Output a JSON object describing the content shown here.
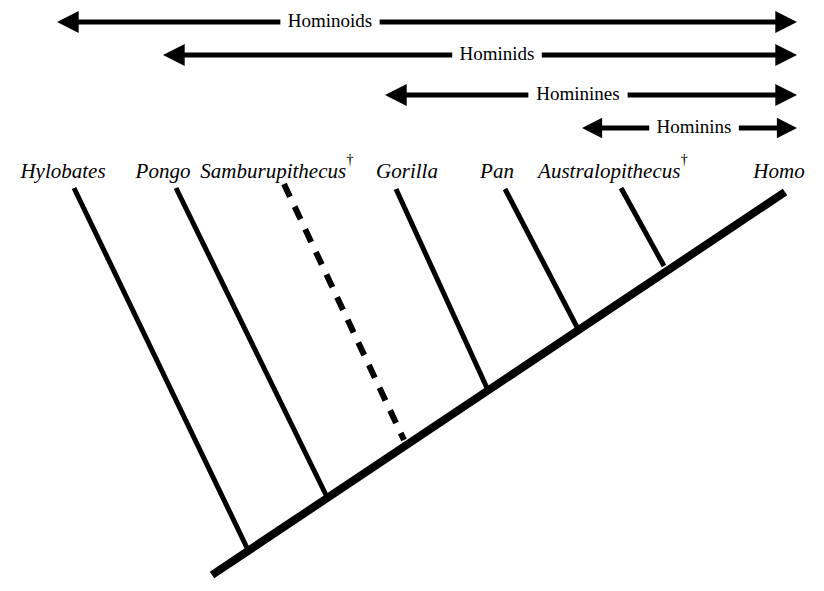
{
  "figure": {
    "kind": "cladogram",
    "background_color": "#ffffff",
    "line_color": "#000000"
  },
  "clade_brackets": [
    {
      "label": "Hominoids",
      "row": 1,
      "y": 22,
      "left_x": 57,
      "right_x": 797,
      "label_center_x": 330,
      "shaft_thickness": 5,
      "head_size": 14,
      "left_arrowhead": true,
      "right_arrowhead": true
    },
    {
      "label": "Hominids",
      "row": 2,
      "y": 55,
      "left_x": 163,
      "right_x": 797,
      "label_center_x": 497,
      "shaft_thickness": 5,
      "head_size": 14,
      "left_arrowhead": true,
      "right_arrowhead": true
    },
    {
      "label": "Hominines",
      "row": 3,
      "y": 95,
      "left_x": 385,
      "right_x": 797,
      "label_center_x": 578,
      "shaft_thickness": 5,
      "head_size": 14,
      "left_arrowhead": true,
      "right_arrowhead": true
    },
    {
      "label": "Hominins",
      "row": 4,
      "y": 128,
      "left_x": 582,
      "right_x": 797,
      "label_center_x": 694,
      "shaft_thickness": 5,
      "head_size": 13,
      "left_arrowhead": true,
      "right_arrowhead": true
    }
  ],
  "taxa": [
    {
      "name": "Hylobates",
      "extinct": false,
      "dagger": "",
      "label_x": 63,
      "label_y": 178,
      "branch": {
        "tip_x": 74,
        "tip_y": 188,
        "node_x": 249,
        "node_y": 552,
        "style": "solid",
        "width": 5
      }
    },
    {
      "name": "Pongo",
      "extinct": false,
      "dagger": "",
      "label_x": 163,
      "label_y": 178,
      "branch": {
        "tip_x": 176,
        "tip_y": 188,
        "node_x": 327,
        "node_y": 497,
        "style": "solid",
        "width": 5
      }
    },
    {
      "name": "Samburupithecus",
      "extinct": true,
      "dagger": "†",
      "label_x": 277,
      "label_y": 178,
      "branch": {
        "tip_x": 284,
        "tip_y": 184,
        "node_x": 404,
        "node_y": 440,
        "style": "dashed",
        "width": 6,
        "dash_pattern": "14 11"
      }
    },
    {
      "name": "Gorilla",
      "extinct": false,
      "dagger": "",
      "label_x": 407,
      "label_y": 178,
      "branch": {
        "tip_x": 396,
        "tip_y": 189,
        "node_x": 487,
        "node_y": 388,
        "style": "solid",
        "width": 5
      }
    },
    {
      "name": "Pan",
      "extinct": false,
      "dagger": "",
      "label_x": 497,
      "label_y": 178,
      "branch": {
        "tip_x": 505,
        "tip_y": 189,
        "node_x": 577,
        "node_y": 327,
        "style": "solid",
        "width": 5
      }
    },
    {
      "name": "Australopithecus",
      "extinct": true,
      "dagger": "†",
      "label_x": 613,
      "label_y": 178,
      "branch": {
        "tip_x": 621,
        "tip_y": 188,
        "node_x": 664,
        "node_y": 266,
        "style": "solid",
        "width": 5
      }
    },
    {
      "name": "Homo",
      "extinct": false,
      "dagger": "",
      "label_x": 779,
      "label_y": 178,
      "branch": null
    }
  ],
  "trunk": {
    "name": "main-lineage",
    "root_x": 212,
    "root_y": 575,
    "tip_x": 785,
    "tip_y": 192,
    "width": 8
  }
}
